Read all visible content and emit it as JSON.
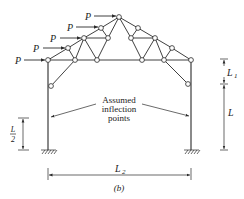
{
  "figure": {
    "caption": "(b)",
    "loads": [
      {
        "label": "P"
      },
      {
        "label": "P"
      },
      {
        "label": "P"
      },
      {
        "label": "P"
      },
      {
        "label": "P"
      }
    ],
    "annotation": {
      "line1": "Assumed",
      "line2": "inflection",
      "line3": "points"
    },
    "dimensions": {
      "L1": "L",
      "L1_sub": "1",
      "L": "L",
      "L2": "L",
      "L2_sub": "2",
      "half_num": "L",
      "half_den": "2"
    },
    "colors": {
      "line": "#2a2a2a",
      "background": "#ffffff"
    }
  }
}
